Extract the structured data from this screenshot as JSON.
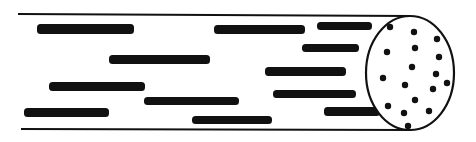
{
  "diagram": {
    "colors": {
      "ink": "#111111",
      "background": "#ffffff"
    },
    "cylinder": {
      "top_edge": {
        "x1": 18,
        "y1": 14,
        "x2": 410,
        "y2": 16
      },
      "bottom_edge": {
        "x1": 21,
        "y1": 129,
        "x2": 410,
        "y2": 130
      },
      "end_face": {
        "cx": 410,
        "cy": 73,
        "rx": 44,
        "ry": 57
      }
    },
    "fibers": [
      {
        "x": 37,
        "y": 24,
        "w": 97,
        "h": 10
      },
      {
        "x": 214,
        "y": 25,
        "w": 91,
        "h": 9
      },
      {
        "x": 317,
        "y": 22,
        "w": 55,
        "h": 8
      },
      {
        "x": 302,
        "y": 44,
        "w": 57,
        "h": 8
      },
      {
        "x": 109,
        "y": 55,
        "w": 101,
        "h": 9
      },
      {
        "x": 265,
        "y": 67,
        "w": 81,
        "h": 9
      },
      {
        "x": 49,
        "y": 82,
        "w": 96,
        "h": 9
      },
      {
        "x": 273,
        "y": 90,
        "w": 83,
        "h": 8
      },
      {
        "x": 144,
        "y": 97,
        "w": 95,
        "h": 8
      },
      {
        "x": 24,
        "y": 108,
        "w": 85,
        "h": 9
      },
      {
        "x": 324,
        "y": 107,
        "w": 56,
        "h": 9
      },
      {
        "x": 192,
        "y": 116,
        "w": 80,
        "h": 8
      }
    ],
    "cross_section_dots": [
      {
        "cx": 390,
        "cy": 27
      },
      {
        "cx": 414,
        "cy": 32
      },
      {
        "cx": 437,
        "cy": 39
      },
      {
        "cx": 415,
        "cy": 48
      },
      {
        "cx": 387,
        "cy": 52
      },
      {
        "cx": 439,
        "cy": 57
      },
      {
        "cx": 412,
        "cy": 67
      },
      {
        "cx": 436,
        "cy": 74
      },
      {
        "cx": 383,
        "cy": 78
      },
      {
        "cx": 447,
        "cy": 83
      },
      {
        "cx": 405,
        "cy": 85
      },
      {
        "cx": 433,
        "cy": 89
      },
      {
        "cx": 415,
        "cy": 100
      },
      {
        "cx": 388,
        "cy": 106
      },
      {
        "cx": 429,
        "cy": 111
      },
      {
        "cx": 404,
        "cy": 113
      },
      {
        "cx": 408,
        "cy": 126
      }
    ]
  }
}
